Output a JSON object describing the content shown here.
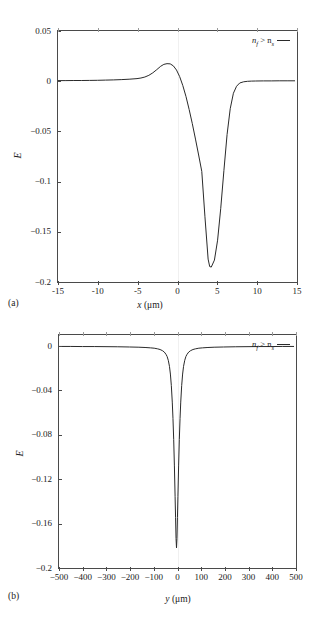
{
  "figure": {
    "panels": [
      {
        "caption": "(a)",
        "legend_text_pre": "n",
        "legend_sub1": "f",
        "legend_mid": " > n",
        "legend_sub2": "s",
        "xlabel_var": "x",
        "xlabel_unit": " (μm)",
        "ylabel": "E"
      },
      {
        "caption": "(b)",
        "legend_text_pre": "n",
        "legend_sub1": "f",
        "legend_mid": " > n",
        "legend_sub2": "s",
        "xlabel_var": "y",
        "xlabel_unit": " (μm)",
        "ylabel": "E"
      }
    ]
  },
  "chart_data": [
    {
      "type": "line",
      "panel": "(a)",
      "title": "",
      "xlabel": "x (μm)",
      "ylabel": "E",
      "xlim": [
        -15,
        15
      ],
      "ylim": [
        -0.2,
        0.05
      ],
      "xticks": [
        -15,
        -10,
        -5,
        0,
        5,
        10,
        15
      ],
      "xticklabels": [
        "-15",
        "-10",
        "-5",
        "0",
        "5",
        "10",
        "15"
      ],
      "yticks": [
        0.05,
        0,
        -0.05,
        -0.1,
        -0.15,
        -0.2
      ],
      "yticklabels": [
        "0.05",
        "0",
        "−0.05",
        "−0.1",
        "−0.15",
        "−0.2"
      ],
      "grid": false,
      "legend": [
        "n_f > n_s"
      ],
      "legend_position": "upper-right",
      "line_color": "#2a2a2a",
      "series": [
        {
          "name": "n_f > n_s",
          "x": [
            -15,
            -14,
            -13,
            -12,
            -11,
            -10,
            -9,
            -8,
            -7,
            -6,
            -5,
            -4.5,
            -4,
            -3.5,
            -3,
            -2.5,
            -2,
            -1.6,
            -1.2,
            -0.8,
            -0.4,
            0,
            0.4,
            0.8,
            1.2,
            1.6,
            2,
            2.4,
            2.8,
            3.2,
            3.6,
            4,
            4.2,
            4.4,
            4.8,
            5.2,
            5.6,
            6,
            6.4,
            6.8,
            7.2,
            7.6,
            8,
            8.5,
            9,
            9.5,
            10,
            11,
            12,
            13,
            14,
            15
          ],
          "y": [
            0.0002,
            0.0002,
            0.0003,
            0.0003,
            0.0004,
            0.0005,
            0.0007,
            0.0009,
            0.0012,
            0.0016,
            0.0022,
            0.0028,
            0.0038,
            0.0055,
            0.008,
            0.0112,
            0.0146,
            0.0165,
            0.0172,
            0.017,
            0.015,
            0.0108,
            0.0042,
            -0.0048,
            -0.0158,
            -0.0288,
            -0.043,
            -0.0585,
            -0.0745,
            -0.091,
            -0.1365,
            -0.179,
            -0.1865,
            -0.187,
            -0.18,
            -0.16,
            -0.128,
            -0.09,
            -0.054,
            -0.028,
            -0.0125,
            -0.0055,
            -0.0022,
            -0.001,
            -0.0005,
            -0.0003,
            -0.0002,
            -0.0001,
            -0.0001,
            0,
            0,
            0
          ]
        }
      ],
      "annotations": {
        "peak_x": -0.9,
        "peak_y": 0.0172,
        "trough_x": 4.3,
        "trough_y": -0.187
      }
    },
    {
      "type": "line",
      "panel": "(b)",
      "title": "",
      "xlabel": "y (μm)",
      "ylabel": "E",
      "xlim": [
        -500,
        500
      ],
      "ylim": [
        -0.2,
        0.01
      ],
      "xticks": [
        -500,
        -400,
        -300,
        -200,
        -100,
        0,
        100,
        200,
        300,
        400,
        500
      ],
      "xticklabels": [
        "−500",
        "−400",
        "−300",
        "−200",
        "−100",
        "0",
        "100",
        "200",
        "300",
        "400",
        "500"
      ],
      "yticks": [
        0,
        -0.04,
        -0.08,
        -0.12,
        -0.16,
        -0.2
      ],
      "yticklabels": [
        "0",
        "−0.04",
        "−0.08",
        "−0.12",
        "−0.16",
        "−0.2"
      ],
      "grid": false,
      "legend": [
        "n_f > n_s"
      ],
      "legend_position": "upper-right",
      "line_color": "#2a2a2a",
      "series": [
        {
          "name": "n_f > n_s",
          "x": [
            -500,
            -450,
            -400,
            -350,
            -300,
            -250,
            -200,
            -160,
            -130,
            -110,
            -95,
            -80,
            -70,
            -60,
            -52,
            -45,
            -40,
            -35,
            -30,
            -26,
            -22,
            -18,
            -15,
            -12,
            -9,
            -6,
            -4,
            -2,
            0,
            2,
            4,
            6,
            9,
            12,
            15,
            18,
            22,
            26,
            30,
            35,
            40,
            45,
            52,
            60,
            70,
            80,
            95,
            110,
            130,
            160,
            200,
            250,
            300,
            350,
            400,
            450,
            500
          ],
          "y": [
            -0.0004,
            -0.0004,
            -0.0005,
            -0.0005,
            -0.0006,
            -0.0007,
            -0.0009,
            -0.0011,
            -0.0014,
            -0.0017,
            -0.002,
            -0.0026,
            -0.0032,
            -0.0042,
            -0.0055,
            -0.0075,
            -0.0095,
            -0.013,
            -0.0185,
            -0.0255,
            -0.036,
            -0.051,
            -0.066,
            -0.085,
            -0.109,
            -0.137,
            -0.156,
            -0.175,
            -0.1835,
            -0.175,
            -0.156,
            -0.137,
            -0.109,
            -0.085,
            -0.066,
            -0.051,
            -0.036,
            -0.0255,
            -0.0185,
            -0.013,
            -0.0095,
            -0.0075,
            -0.0055,
            -0.0042,
            -0.0032,
            -0.0026,
            -0.002,
            -0.0017,
            -0.0014,
            -0.0011,
            -0.0009,
            -0.0007,
            -0.0006,
            -0.0005,
            -0.0005,
            -0.0004,
            -0.0004
          ]
        }
      ],
      "annotations": {
        "trough_x": 0,
        "trough_y": -0.1835
      }
    }
  ]
}
